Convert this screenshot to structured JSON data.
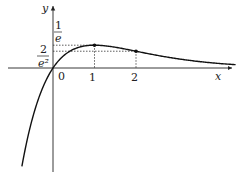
{
  "chart_data": {
    "type": "line",
    "title": "",
    "function": "y = x e^{-x}",
    "xlabel": "x",
    "ylabel": "y",
    "origin_label": "0",
    "x_ticks": [
      "1",
      "2"
    ],
    "y_ticks": [
      {
        "num": "1",
        "den": "e",
        "value": 0.3679
      },
      {
        "num": "2",
        "den": "e²",
        "value": 0.2707
      }
    ],
    "marked_points": [
      {
        "x": 1,
        "y": 0.3679
      },
      {
        "x": 2,
        "y": 0.2707
      }
    ],
    "x": [
      -0.75,
      -0.5,
      -0.25,
      0,
      0.25,
      0.5,
      0.75,
      1,
      1.5,
      2,
      2.5,
      3,
      3.5,
      4,
      4.4
    ],
    "values": [
      -1.588,
      -0.824,
      -0.321,
      0,
      0.195,
      0.303,
      0.354,
      0.368,
      0.335,
      0.271,
      0.205,
      0.149,
      0.106,
      0.073,
      0.054
    ],
    "xlim": [
      -1.1,
      4.5
    ],
    "ylim": [
      -1.7,
      1.1
    ],
    "grid": false,
    "legend": "none"
  }
}
